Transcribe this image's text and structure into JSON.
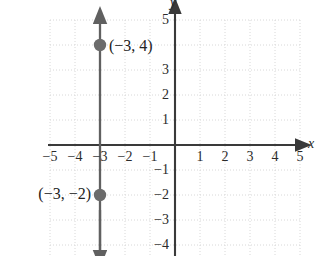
{
  "figure": {
    "kind": "coordinate-plane-graph",
    "background_color": "#ffffff",
    "grid_color": "#d8d8d8",
    "axis_color": "#3a3a3a",
    "line_color": "#606060",
    "point_color": "#6b6b6b",
    "text_color": "#2b2b2b"
  },
  "axes": {
    "x_label": "x",
    "y_label": "y",
    "x_ticks": [
      "−5",
      "−4",
      "−3",
      "−2",
      "−1",
      "1",
      "2",
      "3",
      "4",
      "5"
    ],
    "y_ticks": [
      "5",
      "3",
      "2",
      "1",
      "−1",
      "−2",
      "−3",
      "−4"
    ]
  },
  "chart_data": {
    "type": "line",
    "title": "",
    "xlabel": "x",
    "ylabel": "y",
    "xlim": [
      -5.2,
      5.2
    ],
    "ylim": [
      -4.5,
      5.2
    ],
    "grid": true,
    "legend": "none",
    "series": [
      {
        "name": "x = -3",
        "type": "vertical-line",
        "x": -3,
        "arrow_up": true,
        "arrow_down": true,
        "color": "#606060"
      }
    ],
    "points": [
      {
        "label": "(−3, 4)",
        "x": -3,
        "y": 4,
        "label_side": "right"
      },
      {
        "label": "(−3, −2)",
        "x": -3,
        "y": -2,
        "label_side": "left"
      }
    ],
    "x_tick_values": [
      -5,
      -4,
      -3,
      -2,
      -1,
      1,
      2,
      3,
      4,
      5
    ],
    "y_tick_values": [
      5,
      3,
      2,
      1,
      -1,
      -2,
      -3,
      -4
    ],
    "x_tick_labels": [
      "−5",
      "−4",
      "−3",
      "−2",
      "−1",
      "1",
      "2",
      "3",
      "4",
      "5"
    ],
    "y_tick_labels": [
      "5",
      "3",
      "2",
      "1",
      "−1",
      "−2",
      "−3",
      "−4"
    ]
  }
}
